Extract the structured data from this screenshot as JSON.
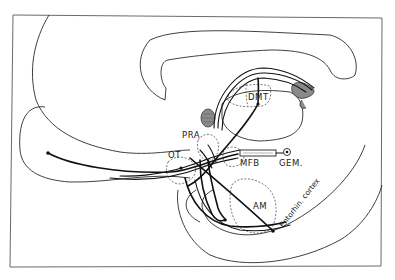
{
  "figure": {
    "type": "schematic neuroanatomy diagram",
    "labels": {
      "dmt": "DMT",
      "pra": "PRA",
      "ot": "OT",
      "mfb": "MFB",
      "gem": "GEM.",
      "am": "AM",
      "entorhinal": "Entorhin. cortex"
    },
    "colors": {
      "background": "#ffffff",
      "line": "#111111",
      "shading": "#888888"
    }
  }
}
